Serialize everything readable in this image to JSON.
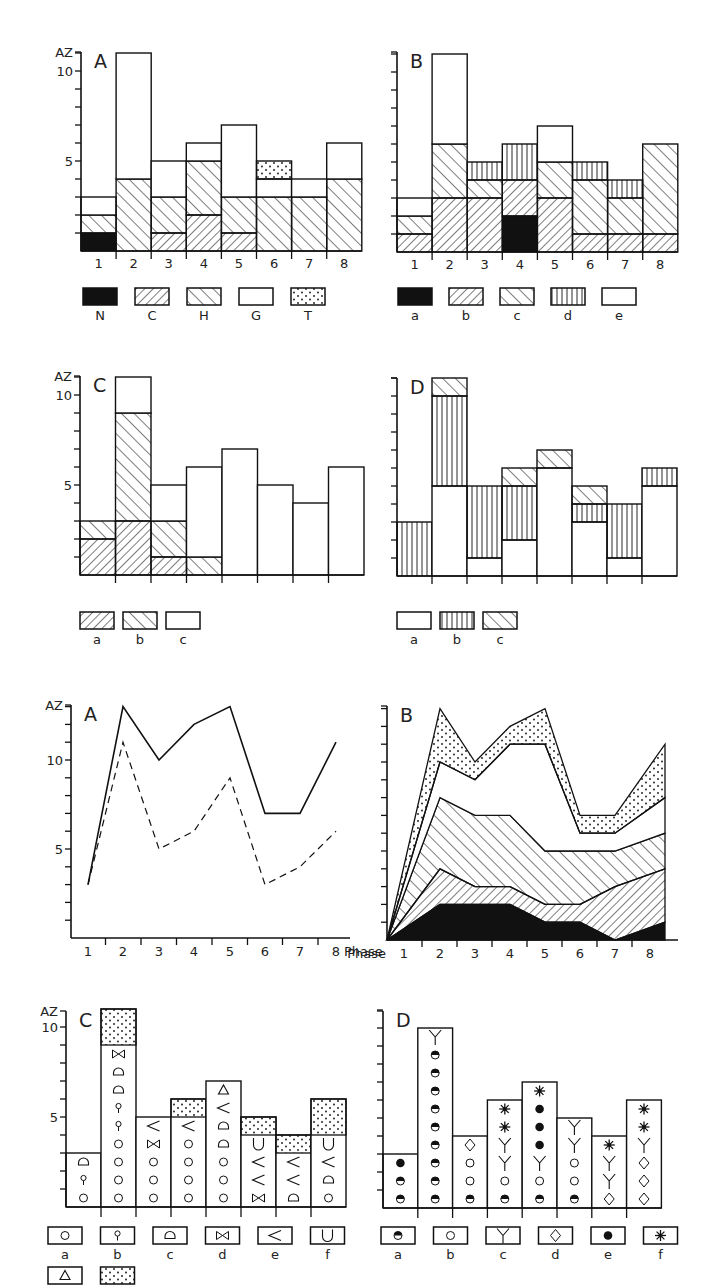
{
  "figure": {
    "y_axis_label": "AZ",
    "x_axis_label": "Phase",
    "panels_row1": [
      "A",
      "B"
    ],
    "panels_row2": [
      "C",
      "D"
    ],
    "panels_row3": [
      "A",
      "B"
    ],
    "panels_row4": [
      "C",
      "D"
    ]
  },
  "colors": {
    "ink": "#111111",
    "background": "#ffffff"
  },
  "chart_data": [
    {
      "id": "row1-A",
      "type": "bar",
      "title": "A",
      "ylabel": "AZ",
      "ylim": [
        0,
        11
      ],
      "yticks": [
        5,
        10
      ],
      "categories": [
        "1",
        "2",
        "3",
        "4",
        "5",
        "6",
        "7",
        "8"
      ],
      "stacked": true,
      "legend": [
        "N",
        "C",
        "H",
        "G",
        "T"
      ],
      "legend_patterns": [
        "solid",
        "hatch-fwd",
        "hatch-back",
        "blank",
        "dots"
      ],
      "series": [
        {
          "name": "N",
          "values": [
            1,
            0,
            0,
            0,
            0,
            0,
            0,
            0
          ]
        },
        {
          "name": "C",
          "values": [
            0,
            0,
            1,
            2,
            1,
            0,
            0,
            0
          ]
        },
        {
          "name": "H",
          "values": [
            1,
            4,
            2,
            3,
            2,
            3,
            3,
            4
          ]
        },
        {
          "name": "G",
          "values": [
            1,
            7,
            2,
            1,
            4,
            1,
            1,
            2
          ]
        },
        {
          "name": "T",
          "values": [
            0,
            0,
            0,
            0,
            0,
            1,
            0,
            0
          ]
        }
      ]
    },
    {
      "id": "row1-B",
      "type": "bar",
      "title": "B",
      "ylim": [
        0,
        11
      ],
      "categories": [
        "1",
        "2",
        "3",
        "4",
        "5",
        "6",
        "7",
        "8"
      ],
      "stacked": true,
      "legend": [
        "a",
        "b",
        "c",
        "d",
        "e"
      ],
      "legend_patterns": [
        "solid",
        "hatch-fwd",
        "hatch-back",
        "vertical",
        "blank"
      ],
      "series": [
        {
          "name": "a",
          "values": [
            0,
            0,
            0,
            2,
            0,
            0,
            0,
            0
          ]
        },
        {
          "name": "b",
          "values": [
            1,
            3,
            3,
            2,
            3,
            1,
            1,
            1
          ]
        },
        {
          "name": "c",
          "values": [
            1,
            3,
            1,
            0,
            2,
            3,
            2,
            5
          ]
        },
        {
          "name": "d",
          "values": [
            0,
            0,
            1,
            2,
            0,
            1,
            1,
            0
          ]
        },
        {
          "name": "e",
          "values": [
            1,
            5,
            0,
            0,
            2,
            0,
            0,
            0
          ]
        }
      ]
    },
    {
      "id": "row2-C",
      "type": "bar",
      "title": "C",
      "ylabel": "AZ",
      "ylim": [
        0,
        11
      ],
      "yticks": [
        5,
        10
      ],
      "categories": [
        "1",
        "2",
        "3",
        "4",
        "5",
        "6",
        "7",
        "8"
      ],
      "stacked": true,
      "legend": [
        "a",
        "b",
        "c"
      ],
      "legend_patterns": [
        "hatch-fwd",
        "hatch-back",
        "blank"
      ],
      "series": [
        {
          "name": "a",
          "values": [
            2,
            3,
            1,
            0,
            0,
            0,
            0,
            0
          ]
        },
        {
          "name": "b",
          "values": [
            1,
            6,
            2,
            1,
            0,
            0,
            0,
            0
          ]
        },
        {
          "name": "c",
          "values": [
            0,
            2,
            2,
            5,
            7,
            5,
            4,
            6
          ]
        }
      ]
    },
    {
      "id": "row2-D",
      "type": "bar",
      "title": "D",
      "ylim": [
        0,
        11
      ],
      "categories": [
        "1",
        "2",
        "3",
        "4",
        "5",
        "6",
        "7",
        "8"
      ],
      "stacked": true,
      "legend": [
        "a",
        "b",
        "c"
      ],
      "legend_patterns": [
        "blank",
        "vertical",
        "hatch-back"
      ],
      "series": [
        {
          "name": "a",
          "values": [
            0,
            5,
            1,
            2,
            6,
            3,
            1,
            5
          ]
        },
        {
          "name": "b",
          "values": [
            3,
            5,
            4,
            3,
            0,
            1,
            3,
            1
          ]
        },
        {
          "name": "c",
          "values": [
            0,
            1,
            0,
            1,
            1,
            1,
            0,
            0
          ]
        }
      ]
    },
    {
      "id": "row3-A",
      "type": "line",
      "title": "A",
      "ylabel": "AZ",
      "xlabel": "Phase",
      "ylim": [
        0,
        13
      ],
      "yticks": [
        5,
        10
      ],
      "x": [
        1,
        2,
        3,
        4,
        5,
        6,
        7,
        8
      ],
      "series": [
        {
          "name": "solid",
          "style": "solid",
          "values": [
            3,
            13,
            10,
            12,
            13,
            7,
            7,
            11
          ]
        },
        {
          "name": "dashed",
          "style": "dashed",
          "values": [
            3,
            11,
            5,
            6,
            9,
            3,
            4,
            6
          ]
        }
      ]
    },
    {
      "id": "row3-B",
      "type": "area",
      "title": "B",
      "xlabel": "Phase",
      "ylim": [
        0,
        13
      ],
      "x": [
        1,
        2,
        3,
        4,
        5,
        6,
        7,
        8
      ],
      "stacked": true,
      "series": [
        {
          "name": "solid",
          "pattern": "solid",
          "top": [
            0,
            2,
            2,
            2,
            1,
            1,
            0,
            1
          ]
        },
        {
          "name": "hatch-fwd",
          "pattern": "hatch-fwd",
          "top": [
            0,
            4,
            3,
            3,
            2,
            2,
            3,
            4
          ]
        },
        {
          "name": "hatch-back",
          "pattern": "hatch-back",
          "top": [
            0,
            8,
            7,
            7,
            5,
            5,
            5,
            6
          ]
        },
        {
          "name": "blank",
          "pattern": "blank",
          "top": [
            0,
            10,
            9,
            11,
            11,
            6,
            6,
            8
          ]
        },
        {
          "name": "dots",
          "pattern": "dots",
          "top": [
            0,
            13,
            10,
            12,
            13,
            7,
            7,
            11
          ]
        }
      ]
    },
    {
      "id": "row4-C",
      "type": "table",
      "title": "C",
      "ylabel": "AZ",
      "ylim": [
        0,
        11
      ],
      "yticks": [
        5,
        10
      ],
      "columns": [
        "1",
        "2",
        "3",
        "4",
        "5",
        "6",
        "7",
        "8"
      ],
      "legend": [
        {
          "label": "a",
          "symbol": "○"
        },
        {
          "label": "b",
          "symbol": "♀"
        },
        {
          "label": "c",
          "symbol": "◗"
        },
        {
          "label": "d",
          "symbol": "⋈"
        },
        {
          "label": "e",
          "symbol": "<"
        },
        {
          "label": "f",
          "symbol": "∪"
        },
        {
          "label": "",
          "symbol": "△"
        },
        {
          "label": "",
          "symbol": "dots"
        }
      ],
      "stacks": [
        [
          "○",
          "♀",
          "◗"
        ],
        [
          "○",
          "○",
          "○",
          "○",
          "♀",
          "♀",
          "◗",
          "◗",
          "⋈",
          "dots2"
        ],
        [
          "○",
          "○",
          "○",
          "⋈",
          "<"
        ],
        [
          "○",
          "○",
          "○",
          "○",
          "<",
          "dots"
        ],
        [
          "○",
          "○",
          "○",
          "◗",
          "◗",
          "<",
          "△"
        ],
        [
          "⋈",
          "<",
          "<",
          "∪",
          "dots"
        ],
        [
          "◗",
          "<",
          "<",
          "dots"
        ],
        [
          "○",
          "◗",
          "<",
          "∪",
          "dots2"
        ]
      ]
    },
    {
      "id": "row4-D",
      "type": "table",
      "title": "D",
      "ylim": [
        0,
        11
      ],
      "columns": [
        "1",
        "2",
        "3",
        "4",
        "5",
        "6",
        "7",
        "8"
      ],
      "legend": [
        {
          "label": "a",
          "symbol": "◓"
        },
        {
          "label": "b",
          "symbol": "○"
        },
        {
          "label": "c",
          "symbol": "Y"
        },
        {
          "label": "d",
          "symbol": "◇"
        },
        {
          "label": "e",
          "symbol": "●"
        },
        {
          "label": "f",
          "symbol": "✱"
        }
      ],
      "stacks": [
        [
          "◓",
          "◓",
          "●"
        ],
        [
          "◓",
          "◓",
          "◓",
          "◓",
          "◓",
          "◓",
          "◓",
          "◓",
          "◓",
          "Y"
        ],
        [
          "◓",
          "○",
          "○",
          "◇"
        ],
        [
          "◓",
          "○",
          "Y",
          "Y",
          "✱",
          "✱"
        ],
        [
          "◓",
          "○",
          "Y",
          "●",
          "●",
          "●",
          "✱"
        ],
        [
          "◓",
          "○",
          "○",
          "Y",
          "Y"
        ],
        [
          "◇",
          "Y",
          "Y",
          "✱"
        ],
        [
          "◇",
          "◇",
          "◇",
          "Y",
          "✱",
          "✱"
        ]
      ]
    }
  ]
}
